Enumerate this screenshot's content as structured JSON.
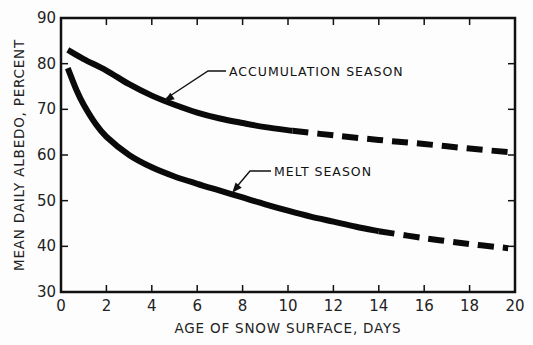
{
  "chart_data": {
    "type": "line",
    "title": "",
    "xlabel": "AGE OF SNOW SURFACE, DAYS",
    "ylabel": "MEAN DAILY ALBEDO, PERCENT",
    "xlim": [
      0,
      20
    ],
    "ylim": [
      30,
      90
    ],
    "xticks": [
      0,
      2,
      4,
      6,
      8,
      10,
      12,
      14,
      16,
      18,
      20
    ],
    "yticks": [
      30,
      40,
      50,
      60,
      70,
      80,
      90
    ],
    "grid": false,
    "legend": "none (inline arrow annotations)",
    "series": [
      {
        "name": "ACCUMULATION SEASON",
        "solid": {
          "x": [
            0.3,
            1,
            2,
            3,
            4,
            5,
            6,
            7,
            8,
            9,
            10.2
          ],
          "y": [
            83,
            81,
            78.5,
            75.5,
            73,
            71,
            69.3,
            68,
            67,
            66.1,
            65.3
          ]
        },
        "dashed": {
          "x": [
            10.2,
            12,
            14,
            16,
            18,
            20
          ],
          "y": [
            65.3,
            64.3,
            63.3,
            62.4,
            61.4,
            60.5
          ]
        }
      },
      {
        "name": "MELT SEASON",
        "solid": {
          "x": [
            0.3,
            0.7,
            1,
            1.5,
            2,
            3,
            4,
            5,
            6,
            7,
            8,
            9,
            10,
            11,
            12,
            13,
            14
          ],
          "y": [
            79,
            74,
            71,
            67,
            64,
            60,
            57.3,
            55.3,
            53.7,
            52.2,
            50.7,
            49.2,
            47.8,
            46.5,
            45.4,
            44.3,
            43.3
          ]
        },
        "dashed": {
          "x": [
            14,
            16,
            18,
            19.7
          ],
          "y": [
            43.3,
            41.8,
            40.5,
            39.6
          ]
        }
      }
    ],
    "annotations": [
      {
        "text": "ACCUMULATION SEASON",
        "points_to": {
          "x": 4.5,
          "y": 71.5
        }
      },
      {
        "text": "MELT SEASON",
        "points_to": {
          "x": 7.5,
          "y": 51.5
        }
      }
    ]
  }
}
